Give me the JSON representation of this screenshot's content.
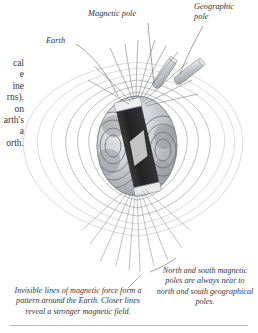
{
  "page": {
    "title_fragment": "y",
    "body_column_lines": [
      "cal",
      "e",
      "ine",
      "rns).",
      "on",
      "arth's",
      "a",
      "orth."
    ]
  },
  "figure": {
    "labels": {
      "earth": "Earth",
      "magnetic_pole": "Magnetic pole",
      "geographic_pole": "Geographic\npole"
    },
    "captions": {
      "left": "Invisible lines of magnetic force form a pattern around the Earth. Closer lines reveal a stronger magnetic field.",
      "right": "North and south magnetic poles are always near to north and south geographical poles."
    },
    "icons": {
      "globe": "earth-globe-icon",
      "bar_magnet": "bar-magnet-icon",
      "magnetic_axis_rod": "magnetic-axis-rod-icon",
      "geographic_axis_rod": "geographic-axis-rod-icon",
      "field_lines": "magnetic-field-lines-icon"
    },
    "colors": {
      "globe_light": "#e2e2e4",
      "globe_mid": "#bfc0c4",
      "globe_dark": "#97989e",
      "magnet_body": "#2b2b2b",
      "magnet_cap": "#efeff0",
      "field_line": "#8e8f97",
      "field_line_faint": "#c9cacf",
      "leader_line": "#6e6f76",
      "text": "#34343a",
      "rule": "#b9b9bd"
    }
  }
}
